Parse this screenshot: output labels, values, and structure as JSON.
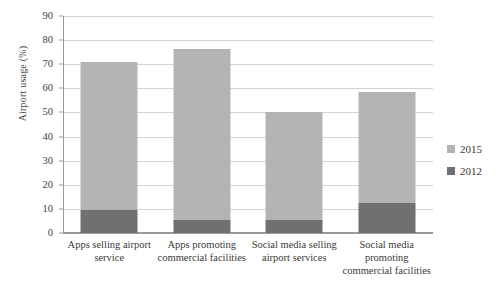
{
  "chart_data": {
    "type": "bar",
    "subtype": "stacked-bar",
    "title": "",
    "xlabel": "",
    "ylabel": "Airport usage (%)",
    "ylim": [
      0,
      90
    ],
    "ytick_step": 10,
    "yticks": [
      90,
      80,
      70,
      60,
      50,
      40,
      30,
      20,
      10,
      0
    ],
    "grid": true,
    "grid_axis": "y",
    "legend_position": "right",
    "categories": [
      "Apps selling airport service",
      "Apps promoting commercial facilities",
      "Social media selling airport services",
      "Social media promoting commercial facilities"
    ],
    "series": [
      {
        "name": "2012",
        "color": "#707070",
        "values": [
          9.5,
          5.5,
          5.5,
          12.5
        ]
      },
      {
        "name": "2015",
        "color": "#b4b4b4",
        "values": [
          61.5,
          71.0,
          44.5,
          46.0
        ]
      }
    ],
    "stack_totals": [
      71.0,
      76.5,
      50.0,
      58.5
    ]
  },
  "legend": {
    "items": [
      {
        "label": "2015",
        "color": "#b4b4b4"
      },
      {
        "label": "2012",
        "color": "#707070"
      }
    ]
  },
  "colors": {
    "series_2015": "#b4b4b4",
    "series_2012": "#707070",
    "gridline": "#d4d4d4",
    "axis": "#9a9a9a",
    "text": "#3a3a3a",
    "background": "#ffffff"
  }
}
